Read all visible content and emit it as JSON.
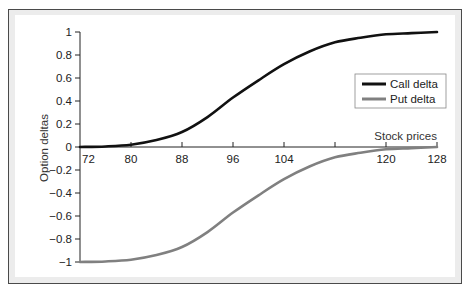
{
  "chart_data": {
    "type": "line",
    "title": "",
    "xlabel": "Stock prices",
    "ylabel": "Option deltas",
    "x": [
      72,
      76,
      80,
      84,
      88,
      92,
      96,
      100,
      104,
      108,
      112,
      116,
      120,
      124,
      128
    ],
    "series": [
      {
        "name": "Call delta",
        "color": "#111111",
        "values": [
          0.0,
          0.005,
          0.02,
          0.06,
          0.13,
          0.26,
          0.43,
          0.58,
          0.72,
          0.83,
          0.91,
          0.95,
          0.98,
          0.99,
          1.0
        ]
      },
      {
        "name": "Put delta",
        "color": "#808080",
        "values": [
          -1.0,
          -0.995,
          -0.98,
          -0.94,
          -0.87,
          -0.74,
          -0.57,
          -0.42,
          -0.28,
          -0.17,
          -0.09,
          -0.05,
          -0.02,
          -0.01,
          0.0
        ]
      }
    ],
    "xticks": [
      72,
      80,
      88,
      96,
      104,
      112,
      120,
      128
    ],
    "xtick_labels": [
      "72",
      "80",
      "88",
      "96",
      "104",
      "",
      "120",
      "128"
    ],
    "yticks": [
      1,
      0.8,
      0.6,
      0.4,
      0.2,
      0,
      -0.2,
      -0.4,
      -0.6,
      -0.8,
      -1
    ],
    "ytick_labels": [
      "1",
      "0.8",
      "0.6",
      "0.4",
      "0.2",
      "0",
      "−0.2",
      "−0.4",
      "−0.6",
      "−0.8",
      "−1"
    ],
    "xlim": [
      72,
      128
    ],
    "ylim": [
      -1,
      1
    ],
    "grid": false,
    "legend_position": "right, upper-middle"
  }
}
